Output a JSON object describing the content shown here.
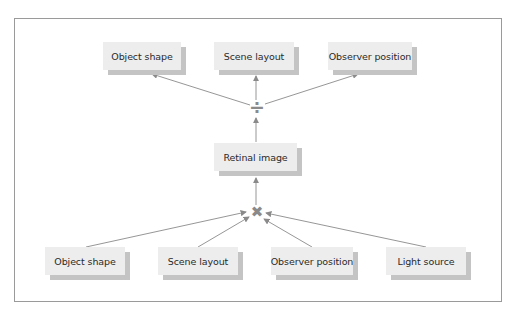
{
  "diagram": {
    "outputs": [
      {
        "label": "Object shape"
      },
      {
        "label": "Scene layout"
      },
      {
        "label": "Observer position"
      }
    ],
    "divide_operator": {
      "symbol": "÷",
      "name": "divide"
    },
    "center": {
      "label": "Retinal image"
    },
    "multiply_operator": {
      "symbol": "✖",
      "name": "multiply"
    },
    "inputs": [
      {
        "label": "Object shape"
      },
      {
        "label": "Scene layout"
      },
      {
        "label": "Observer position"
      },
      {
        "label": "Light source"
      }
    ],
    "colors": {
      "box_fill": "#ededed",
      "box_shadow": "#c4c4c4",
      "arrow": "#8a8a8a",
      "frame": "#9a9a9a"
    }
  }
}
